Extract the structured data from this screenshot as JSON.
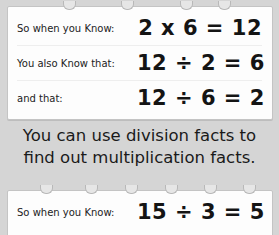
{
  "card1": {
    "rows": [
      {
        "label": "So when you Know:",
        "equation": "2 x 6 = 12"
      },
      {
        "label": "You also Know that:",
        "equation": "12 ÷ 2 = 6"
      },
      {
        "label": "and that:",
        "equation": "12 ÷ 6 = 2"
      }
    ]
  },
  "caption": {
    "line1": "You can use division facts to",
    "line2": "find out multiplication facts."
  },
  "card2": {
    "rows": [
      {
        "label": "So when you Know:",
        "equation": "15 ÷ 3 = 5"
      }
    ]
  },
  "colors": {
    "background": "#d5d5d5",
    "card": "#fdfdfd",
    "text": "#141414"
  }
}
